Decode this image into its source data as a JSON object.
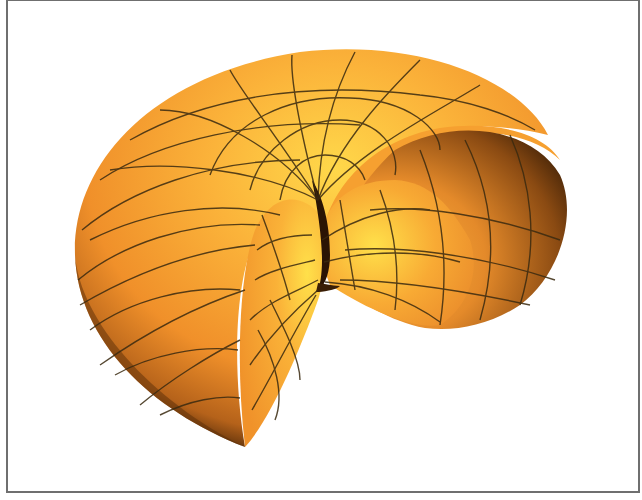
{
  "figure": {
    "surface_color": "#f59a2a",
    "highlight_color": "#ffe04a",
    "shadow_color": "#4a2608",
    "grid_color": "#3a2a10",
    "frame_color": "#6f6f6f"
  },
  "caption": ""
}
